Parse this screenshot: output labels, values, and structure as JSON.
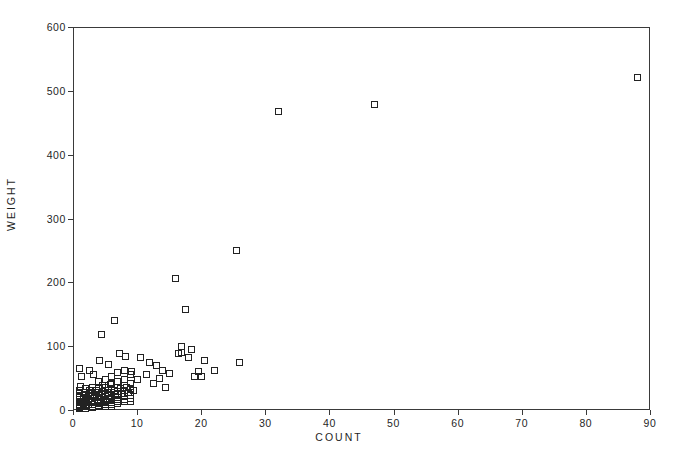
{
  "chart_data": {
    "type": "scatter",
    "title": "",
    "xlabel": "COUNT",
    "ylabel": "WEIGHT",
    "xlim": [
      0,
      90
    ],
    "ylim": [
      0,
      600
    ],
    "xticks": [
      0,
      10,
      20,
      30,
      40,
      50,
      60,
      70,
      80,
      90
    ],
    "xtick_labels": [
      "0",
      "10",
      "20",
      "30",
      "40",
      "50",
      "60",
      "70",
      "80",
      "90"
    ],
    "yticks": [
      0,
      100,
      200,
      300,
      400,
      500,
      600
    ],
    "ytick_labels": [
      "0",
      "100",
      "200",
      "300",
      "400",
      "500",
      "600"
    ],
    "grid": false,
    "legend": null,
    "marker": "open-square",
    "marker_color": "#222222",
    "marker_size_px": 7,
    "frame": true,
    "series": [
      {
        "name": "observations",
        "points": [
          [
            1,
            65
          ],
          [
            1.4,
            52
          ],
          [
            1.2,
            37
          ],
          [
            1,
            30
          ],
          [
            1,
            26
          ],
          [
            1,
            22
          ],
          [
            1,
            19
          ],
          [
            1,
            16
          ],
          [
            1,
            13
          ],
          [
            1,
            11
          ],
          [
            1,
            9
          ],
          [
            1,
            7
          ],
          [
            1,
            5
          ],
          [
            1,
            4
          ],
          [
            1,
            3
          ],
          [
            1.6,
            23
          ],
          [
            1.6,
            18
          ],
          [
            1.6,
            14
          ],
          [
            1.6,
            10
          ],
          [
            1.6,
            7
          ],
          [
            1.6,
            5
          ],
          [
            1.8,
            28
          ],
          [
            2,
            33
          ],
          [
            2,
            24
          ],
          [
            2,
            20
          ],
          [
            2,
            17
          ],
          [
            2,
            14
          ],
          [
            2,
            11
          ],
          [
            2,
            9
          ],
          [
            2,
            7
          ],
          [
            2,
            5
          ],
          [
            2,
            3
          ],
          [
            2.4,
            21
          ],
          [
            2.4,
            16
          ],
          [
            2.4,
            12
          ],
          [
            2.4,
            8
          ],
          [
            2.6,
            30
          ],
          [
            2.8,
            18
          ],
          [
            3,
            35
          ],
          [
            3,
            27
          ],
          [
            3,
            22
          ],
          [
            3,
            18
          ],
          [
            3,
            15
          ],
          [
            3,
            12
          ],
          [
            3,
            9
          ],
          [
            3,
            6
          ],
          [
            3,
            4
          ],
          [
            3.4,
            25
          ],
          [
            3.4,
            19
          ],
          [
            3.4,
            14
          ],
          [
            3.6,
            31
          ],
          [
            3.8,
            11
          ],
          [
            4,
            44
          ],
          [
            4,
            34
          ],
          [
            4,
            28
          ],
          [
            4,
            23
          ],
          [
            4,
            19
          ],
          [
            4,
            16
          ],
          [
            4,
            13
          ],
          [
            4,
            10
          ],
          [
            4,
            7
          ],
          [
            4,
            5
          ],
          [
            4.4,
            26
          ],
          [
            4.4,
            20
          ],
          [
            4.6,
            38
          ],
          [
            4.8,
            15
          ],
          [
            5,
            48
          ],
          [
            5,
            36
          ],
          [
            5,
            30
          ],
          [
            5,
            25
          ],
          [
            5,
            21
          ],
          [
            5,
            17
          ],
          [
            5,
            14
          ],
          [
            5,
            11
          ],
          [
            5,
            8
          ],
          [
            5,
            5
          ],
          [
            5.4,
            28
          ],
          [
            5.6,
            22
          ],
          [
            5.8,
            40
          ],
          [
            6,
            52
          ],
          [
            6,
            41
          ],
          [
            6,
            33
          ],
          [
            6,
            27
          ],
          [
            6,
            23
          ],
          [
            6,
            19
          ],
          [
            6,
            16
          ],
          [
            6,
            12
          ],
          [
            6,
            9
          ],
          [
            6,
            6
          ],
          [
            6.4,
            30
          ],
          [
            6.6,
            24
          ],
          [
            7,
            58
          ],
          [
            7,
            45
          ],
          [
            7,
            36
          ],
          [
            7,
            29
          ],
          [
            7,
            24
          ],
          [
            7,
            20
          ],
          [
            7,
            16
          ],
          [
            7,
            13
          ],
          [
            7,
            10
          ],
          [
            7.4,
            33
          ],
          [
            7.6,
            26
          ],
          [
            8,
            62
          ],
          [
            8,
            48
          ],
          [
            8,
            38
          ],
          [
            8,
            31
          ],
          [
            8,
            26
          ],
          [
            8,
            21
          ],
          [
            8,
            17
          ],
          [
            8,
            13
          ],
          [
            8.4,
            35
          ],
          [
            8.6,
            28
          ],
          [
            9,
            55
          ],
          [
            9,
            42
          ],
          [
            9,
            34
          ],
          [
            9,
            27
          ],
          [
            9,
            22
          ],
          [
            9,
            18
          ],
          [
            9,
            14
          ],
          [
            9.5,
            30
          ],
          [
            2.5,
            62
          ],
          [
            3.2,
            55
          ],
          [
            4.5,
            118
          ],
          [
            4.2,
            78
          ],
          [
            5.5,
            72
          ],
          [
            6.5,
            140
          ],
          [
            7.2,
            88
          ],
          [
            8.2,
            84
          ],
          [
            9.2,
            60
          ],
          [
            10,
            47
          ],
          [
            10.5,
            83
          ],
          [
            11.5,
            56
          ],
          [
            12,
            74
          ],
          [
            12.5,
            41
          ],
          [
            13,
            70
          ],
          [
            13.5,
            49
          ],
          [
            14,
            62
          ],
          [
            14.5,
            35
          ],
          [
            15,
            57
          ],
          [
            16,
            206
          ],
          [
            16.5,
            88
          ],
          [
            17,
            100
          ],
          [
            17,
            90
          ],
          [
            17.5,
            157
          ],
          [
            18,
            82
          ],
          [
            18.5,
            95
          ],
          [
            19,
            53
          ],
          [
            19.5,
            60
          ],
          [
            20,
            52
          ],
          [
            20.5,
            78
          ],
          [
            22,
            62
          ],
          [
            25.5,
            250
          ],
          [
            26,
            75
          ],
          [
            32,
            468
          ],
          [
            47,
            478
          ],
          [
            88,
            521
          ]
        ]
      }
    ]
  },
  "axes": {
    "x_axis_name": "count-axis",
    "y_axis_name": "weight-axis"
  }
}
